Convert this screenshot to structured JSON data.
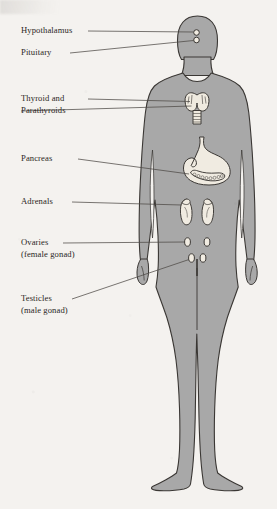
{
  "figure": {
    "body_fill": "#a8a8a8",
    "body_outline": "#3a3734",
    "organ_fill": "#eeeae0",
    "organ_outline": "#4a4642",
    "background": "#f4f2ef",
    "leader_color": "#4e4a46"
  },
  "labels": [
    {
      "id": "hypothalamus",
      "text": "Hypothalamus",
      "sub": ""
    },
    {
      "id": "pituitary",
      "text": "Pituitary",
      "sub": ""
    },
    {
      "id": "thyroid",
      "text": "Thyroid and",
      "sub": "Parathyroids"
    },
    {
      "id": "pancreas",
      "text": "Pancreas",
      "sub": ""
    },
    {
      "id": "adrenals",
      "text": "Adrenals",
      "sub": ""
    },
    {
      "id": "ovaries",
      "text": "Ovaries",
      "sub": "(female gonad)"
    },
    {
      "id": "testicles",
      "text": "Testicles",
      "sub": "(male gonad)"
    }
  ],
  "organs": [
    {
      "id": "hypothalamus-gland",
      "name": "hypothalamus"
    },
    {
      "id": "pituitary-gland",
      "name": "pituitary"
    },
    {
      "id": "thyroid-gland",
      "name": "thyroid and parathyroids"
    },
    {
      "id": "stomach-outline",
      "name": "stomach"
    },
    {
      "id": "pancreas-gland",
      "name": "pancreas"
    },
    {
      "id": "adrenal-left",
      "name": "left adrenal and kidney"
    },
    {
      "id": "adrenal-right",
      "name": "right adrenal and kidney"
    },
    {
      "id": "ovary-left",
      "name": "left ovary"
    },
    {
      "id": "ovary-right",
      "name": "right ovary"
    },
    {
      "id": "testicle-left",
      "name": "left testicle"
    },
    {
      "id": "testicle-right",
      "name": "right testicle"
    }
  ]
}
